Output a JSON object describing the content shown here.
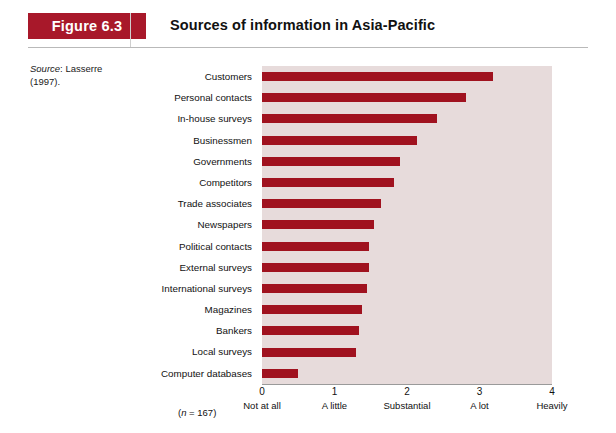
{
  "figure": {
    "badge": "Figure 6.3",
    "title": "Sources of information in Asia-Pacific",
    "source_label": "Source",
    "source_text": ": Lasserre",
    "source_line2": "(1997).",
    "sample_note_prefix": "(",
    "sample_note_n": "n",
    "sample_note_rest": " = 167)",
    "accent_color": "#a8182a",
    "bar_color": "#a0121f",
    "plot_bg_color": "#e7dbdb"
  },
  "chart_data": {
    "type": "bar",
    "orientation": "horizontal",
    "title": "Sources of information in Asia-Pacific",
    "xlabel": "",
    "ylabel": "",
    "xlim": [
      0,
      4
    ],
    "grid": false,
    "legend": "none",
    "sample_size": 167,
    "categories": [
      "Customers",
      "Personal contacts",
      "In-house surveys",
      "Businessmen",
      "Governments",
      "Competitors",
      "Trade associates",
      "Newspapers",
      "Political contacts",
      "External surveys",
      "International surveys",
      "Magazines",
      "Bankers",
      "Local surveys",
      "Computer databases"
    ],
    "values": [
      3.19,
      2.82,
      2.42,
      2.14,
      1.9,
      1.82,
      1.64,
      1.54,
      1.48,
      1.48,
      1.45,
      1.38,
      1.34,
      1.3,
      0.49
    ],
    "xticks": [
      {
        "value": 0,
        "num": "0",
        "text": "Not at all"
      },
      {
        "value": 1,
        "num": "1",
        "text": "A little"
      },
      {
        "value": 2,
        "num": "2",
        "text": "Substantial"
      },
      {
        "value": 3,
        "num": "3",
        "text": "A lot"
      },
      {
        "value": 4,
        "num": "4",
        "text": "Heavily"
      }
    ]
  }
}
